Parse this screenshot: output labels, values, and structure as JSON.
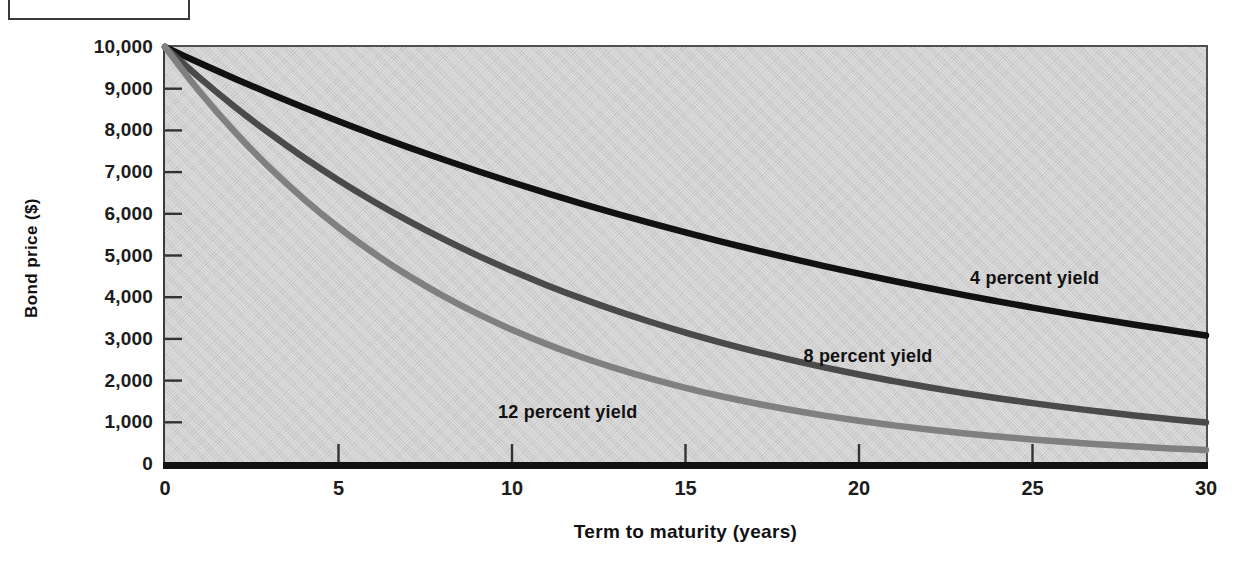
{
  "figure": {
    "crop_fragment_present": true
  },
  "chart_data": {
    "type": "line",
    "title": "",
    "xlabel": "Term to maturity (years)",
    "ylabel": "Bond price ($)",
    "xlim": [
      0,
      30
    ],
    "ylim": [
      0,
      10000
    ],
    "grid": false,
    "legend_position": "inline-annotations",
    "x_ticks": [
      "0",
      "5",
      "10",
      "15",
      "20",
      "25",
      "30"
    ],
    "x_tick_values": [
      0,
      5,
      10,
      15,
      20,
      25,
      30
    ],
    "y_ticks": [
      "10,000",
      "9,000",
      "8,000",
      "7,000",
      "6,000",
      "5,000",
      "4,000",
      "3,000",
      "2,000",
      "1,000",
      "0"
    ],
    "y_tick_values": [
      10000,
      9000,
      8000,
      7000,
      6000,
      5000,
      4000,
      3000,
      2000,
      1000,
      0
    ],
    "x": [
      0,
      1,
      2,
      3,
      4,
      5,
      6,
      7,
      8,
      9,
      10,
      11,
      12,
      13,
      14,
      15,
      16,
      17,
      18,
      19,
      20,
      21,
      22,
      23,
      24,
      25,
      26,
      27,
      28,
      29,
      30
    ],
    "series": [
      {
        "name": "4 percent yield",
        "color": "#111111",
        "label": "4 percent yield",
        "values": [
          10000,
          9615,
          9246,
          8890,
          8548,
          8219,
          7903,
          7599,
          7307,
          7026,
          6756,
          6496,
          6246,
          6006,
          5775,
          5553,
          5339,
          5134,
          4936,
          4746,
          4564,
          4388,
          4220,
          4057,
          3901,
          3751,
          3607,
          3468,
          3335,
          3207,
          3083
        ]
      },
      {
        "name": "8 percent yield",
        "color": "#4a4a4a",
        "label": "8 percent yield",
        "values": [
          10000,
          9259,
          8573,
          7938,
          7350,
          6806,
          6302,
          5835,
          5403,
          5002,
          4632,
          4289,
          3971,
          3677,
          3405,
          3152,
          2919,
          2703,
          2502,
          2317,
          2145,
          1987,
          1839,
          1703,
          1577,
          1460,
          1352,
          1252,
          1159,
          1073,
          994
        ]
      },
      {
        "name": "12 percent yield",
        "color": "#808080",
        "label": "12 percent yield",
        "values": [
          10000,
          8929,
          7972,
          7118,
          6355,
          5674,
          5066,
          4523,
          4039,
          3606,
          3220,
          2875,
          2567,
          2292,
          2046,
          1827,
          1631,
          1456,
          1300,
          1161,
          1037,
          926,
          826,
          738,
          659,
          588,
          525,
          469,
          419,
          374,
          334
        ]
      }
    ],
    "annotations": [
      {
        "text": "4 percent yield",
        "x": 23.2,
        "y": 4430
      },
      {
        "text": "8 percent yield",
        "x": 18.4,
        "y": 2560
      },
      {
        "text": "12 percent yield",
        "x": 9.6,
        "y": 1220
      }
    ]
  }
}
